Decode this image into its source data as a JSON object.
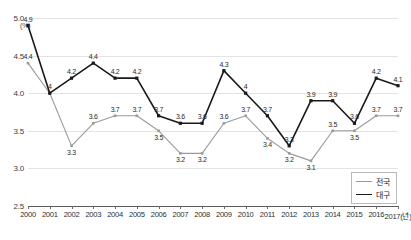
{
  "chart_data": {
    "type": "line",
    "title": "",
    "subtitle": "",
    "xlabel": "(년)",
    "ylabel": "(%)",
    "x_axis_suffix_label": "2017(년)",
    "categories": [
      "2000",
      "2001",
      "2002",
      "2003",
      "2004",
      "2005",
      "2006",
      "2007",
      "2008",
      "2009",
      "2010",
      "2011",
      "2012",
      "2013",
      "2014",
      "2015",
      "2016",
      "2017"
    ],
    "ylim": [
      2.5,
      5.0
    ],
    "ytick_labels": [
      "2.5",
      "3.0",
      "3.5",
      "4.0",
      "4.5",
      "5.0"
    ],
    "ytick_values": [
      2.5,
      3.0,
      3.5,
      4.0,
      4.5,
      5.0
    ],
    "grid": true,
    "legend_position": "bottom-right",
    "series": [
      {
        "name": "전국",
        "color": "#9a9a9a",
        "values": [
          4.4,
          4.0,
          3.3,
          3.6,
          3.7,
          3.7,
          3.5,
          3.2,
          3.2,
          3.6,
          3.7,
          3.4,
          3.2,
          3.1,
          3.5,
          3.5,
          3.7,
          3.7
        ],
        "point_labels": [
          "4.4",
          "",
          "3.3",
          "3.6",
          "3.7",
          "3.7",
          "3.5",
          "3.2",
          "3.2",
          "3.6",
          "3.7",
          "3.4",
          "3.2",
          "3.1",
          "3.5",
          "3.5",
          "3.7",
          "3.7"
        ],
        "label_positions": [
          "above",
          "above",
          "below",
          "above",
          "above",
          "above",
          "below",
          "below",
          "below",
          "above",
          "above",
          "below",
          "below",
          "below",
          "above",
          "below",
          "above",
          "above"
        ]
      },
      {
        "name": "대구",
        "color": "#1a1a1a",
        "values": [
          4.9,
          4.0,
          4.2,
          4.4,
          4.2,
          4.2,
          3.7,
          3.6,
          3.6,
          4.3,
          4.0,
          3.7,
          3.3,
          3.9,
          3.9,
          3.6,
          4.2,
          4.1
        ],
        "point_labels": [
          "4.9",
          "4",
          "4.2",
          "4.4",
          "4.2",
          "4.2",
          "3.7",
          "3.6",
          "3.6",
          "4.3",
          "4",
          "3.7",
          "3.3",
          "3.9",
          "3.9",
          "3.6",
          "4.2",
          "4.1"
        ],
        "label_positions": [
          "above",
          "above",
          "above",
          "above",
          "above",
          "above",
          "above",
          "above",
          "above",
          "above",
          "above",
          "above",
          "above",
          "above",
          "above",
          "above",
          "above",
          "above"
        ]
      }
    ]
  },
  "legend": {
    "items": [
      {
        "label": "전국",
        "color": "#9a9a9a"
      },
      {
        "label": "대구",
        "color": "#1a1a1a"
      }
    ]
  },
  "axes": {
    "y_unit": "(%)"
  }
}
